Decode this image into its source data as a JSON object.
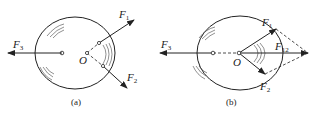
{
  "figure_a": {
    "caption": "(a)",
    "forces": [
      {
        "name": "F",
        "sub": "1"
      },
      {
        "name": "F",
        "sub": "2"
      },
      {
        "name": "F",
        "sub": "3"
      }
    ],
    "point_label": "O"
  },
  "figure_b": {
    "caption": "(b)",
    "forces": [
      {
        "name": "F",
        "sub": "1"
      },
      {
        "name": "F",
        "sub": "2"
      },
      {
        "name": "F",
        "sub": "3"
      },
      {
        "name": "F",
        "sub": "12"
      }
    ],
    "point_label": "O"
  },
  "colors": {
    "ink": "#222222",
    "background": "#ffffff"
  }
}
